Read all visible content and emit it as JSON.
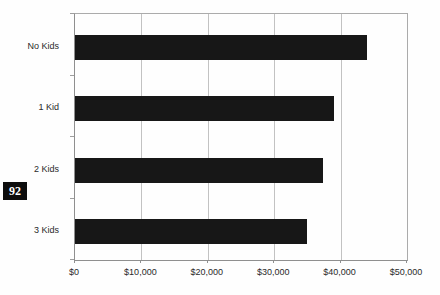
{
  "page": {
    "page_number": "92",
    "background_color": "#fefefe"
  },
  "chart_data": {
    "type": "bar",
    "orientation": "horizontal",
    "title": "",
    "xlabel": "",
    "ylabel": "",
    "categories": [
      "No Kids",
      "1 Kid",
      "2 Kids",
      "3 Kids"
    ],
    "values": [
      44000,
      39000,
      37300,
      35000
    ],
    "xlim": [
      0,
      50000
    ],
    "x_ticks": [
      0,
      10000,
      20000,
      30000,
      40000,
      50000
    ],
    "x_tick_labels": [
      "$0",
      "$10,000",
      "$20,000",
      "$30,000",
      "$40,000",
      "$50,000"
    ],
    "grid": true,
    "legend": false,
    "bar_color": "#171717",
    "gridline_color": "#c2c2c2",
    "axis_color": "#8f8f8f",
    "label_color": "#2a2a2a"
  }
}
